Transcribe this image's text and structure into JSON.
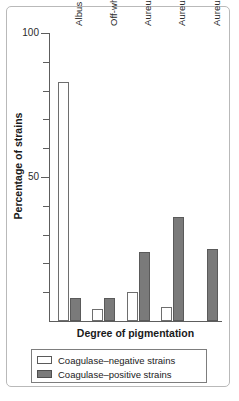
{
  "chart_data": {
    "type": "bar",
    "title": "",
    "xlabel": "Degree of pigmentation",
    "ylabel": "Percentage of strains",
    "ylim": [
      0,
      100
    ],
    "ytick_labels": [
      "50",
      "100"
    ],
    "ytick_values": [
      50,
      100
    ],
    "minor_tick_values": [
      10,
      20,
      30,
      40,
      60,
      70,
      80,
      90
    ],
    "grid": false,
    "legend_position": "bottom",
    "categories": [
      "Albus",
      "Off-white",
      "Aureus+",
      "Aureus++",
      "Aureus+++"
    ],
    "series": [
      {
        "name": "Coagulase–negative strains",
        "color": "#ffffff",
        "values": [
          83,
          4,
          10,
          5,
          0
        ]
      },
      {
        "name": "Coagulase–positive strains",
        "color": "#7a7a7a",
        "values": [
          8,
          8,
          24,
          36,
          25
        ]
      }
    ]
  },
  "legend": {
    "entries": [
      {
        "label": "Coagulase–negative strains"
      },
      {
        "label": "Coagulase–positive strains"
      }
    ]
  },
  "colors": {
    "positive_fill": "#7a7a7a",
    "negative_fill": "#ffffff",
    "axis": "#5d5d5d",
    "frame": "#b9b9b9",
    "text": "#1a1a1a"
  }
}
